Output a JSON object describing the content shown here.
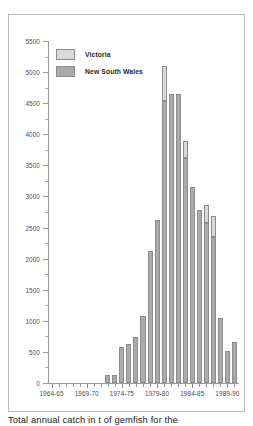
{
  "caption": "Total annual catch in t of gemfish for the",
  "colors": {
    "victoria": "#d9d9d9",
    "new_south_wales": "#aaaaaa",
    "axis": "#9a9a9a",
    "frame": "#b9b9b9",
    "text": "#4d4d4d"
  },
  "legend": {
    "position": "top-left",
    "entries": [
      {
        "label": "Victoria",
        "color": "#d9d9d9"
      },
      {
        "label": "New South Wales",
        "color": "#aaaaaa"
      }
    ]
  },
  "chart_data": {
    "type": "bar",
    "subtype": "stacked",
    "title": "",
    "xlabel": "",
    "ylabel": "",
    "ylim": [
      0,
      5500
    ],
    "ytick_step": 500,
    "yminor_step": 250,
    "grid": false,
    "ytick_labels": [
      "0",
      "500",
      "1000",
      "1500",
      "2000",
      "2500",
      "3000",
      "3500",
      "4000",
      "4500",
      "5000",
      "5500"
    ],
    "ytick_values": [
      0,
      500,
      1000,
      1500,
      2000,
      2500,
      3000,
      3500,
      4000,
      4500,
      5000,
      5500
    ],
    "xtick_labels": [
      "1964-65",
      "1969-70",
      "1974-75",
      "1979-80",
      "1984-85",
      "1989-90"
    ],
    "xtick_categories": [
      "1964-65",
      "1969-70",
      "1974-75",
      "1979-80",
      "1984-85",
      "1989-90"
    ],
    "categories": [
      "1964-65",
      "1965-66",
      "1966-67",
      "1967-68",
      "1968-69",
      "1969-70",
      "1970-71",
      "1971-72",
      "1972-73",
      "1973-74",
      "1974-75",
      "1975-76",
      "1976-77",
      "1977-78",
      "1978-79",
      "1979-80",
      "1980-81",
      "1981-82",
      "1982-83",
      "1983-84",
      "1984-85",
      "1985-86",
      "1986-87",
      "1987-88",
      "1988-89",
      "1989-90",
      "1990-91"
    ],
    "series": [
      {
        "name": "New South Wales",
        "color": "#aaaaaa",
        "values": [
          0,
          0,
          0,
          0,
          0,
          0,
          0,
          0,
          130,
          130,
          580,
          620,
          740,
          1080,
          2120,
          2620,
          4530,
          4640,
          4650,
          3620,
          3150,
          2780,
          2570,
          2350,
          360,
          0,
          0
        ]
      },
      {
        "name": "Victoria",
        "color": "#d9d9d9",
        "values": [
          0,
          0,
          0,
          0,
          0,
          0,
          0,
          0,
          0,
          0,
          0,
          0,
          0,
          0,
          0,
          0,
          570,
          0,
          0,
          280,
          0,
          0,
          300,
          330,
          130,
          0,
          0
        ]
      }
    ],
    "totals": [
      0,
      0,
      0,
      0,
      0,
      0,
      0,
      0,
      130,
      130,
      580,
      620,
      740,
      1080,
      2120,
      2620,
      5100,
      4640,
      4650,
      3900,
      3150,
      2780,
      2870,
      2680,
      490,
      0,
      0
    ],
    "extra_bars": [
      {
        "category": "1988-89",
        "new_south_wales": 1040,
        "victoria": 0
      },
      {
        "category": "1989-90",
        "new_south_wales": 510,
        "victoria": 0
      },
      {
        "category": "1990-91",
        "new_south_wales": 660,
        "victoria": 0
      }
    ],
    "peak": {
      "category": "1980-81",
      "value": 5100
    }
  }
}
